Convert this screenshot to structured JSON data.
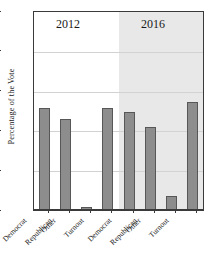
{
  "chart_data": {
    "type": "bar",
    "title": "",
    "xlabel": "",
    "ylabel": "Percentage of the Vote",
    "ylim": [
      0,
      100
    ],
    "yticks": [
      0,
      20,
      40,
      60,
      80,
      100
    ],
    "grid": true,
    "legend": "none",
    "panel_layout": "faceted-columns",
    "categories": [
      "Democrat",
      "Republican",
      "Other",
      "Turnout"
    ],
    "panels": [
      {
        "name": "2012",
        "shaded": false,
        "values": [
          52,
          46,
          2,
          52
        ]
      },
      {
        "name": "2016",
        "shaded": true,
        "values": [
          50,
          42,
          7.5,
          55
        ]
      }
    ]
  },
  "axes": {
    "y_title": "Percentage of the Vote",
    "y_tick_labels": [
      "0",
      "20",
      "40",
      "60",
      "80",
      "100"
    ],
    "x_tick_labels_panel_2012": [
      "Democrat",
      "Republican",
      "Other",
      "Turnout"
    ],
    "x_tick_labels_panel_2016": [
      "Democrat",
      "Republican",
      "Other",
      "Turnout"
    ]
  },
  "panel_titles": {
    "left": "2012",
    "right": "2016"
  },
  "colors": {
    "bar_fill": "#8d8d8d",
    "bar_stroke": "#575757",
    "panel_shade": "#e8e8e8",
    "gridline": "#d2d2d2",
    "axis": "#3a3a3a",
    "background": "#ffffff",
    "text": "#1a1a1a"
  }
}
